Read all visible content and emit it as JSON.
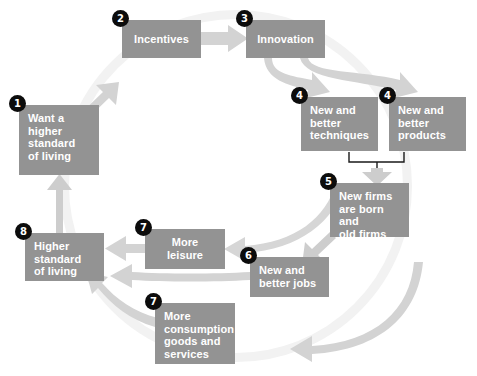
{
  "diagram": {
    "colors": {
      "box_fill": "#939393",
      "box_text": "#ffffff",
      "arrow_fill": "#cdcdcd",
      "badge_fill": "#0c0c0c",
      "badge_text": "#ffffff",
      "background": "#ffffff",
      "ring": "#f2f2f2"
    },
    "nodes": [
      {
        "id": "n1",
        "number": "1",
        "label": "Want a\nhigher\nstandard\nof living",
        "x": 19,
        "y": 105,
        "w": 80,
        "h": 70
      },
      {
        "id": "n2",
        "number": "2",
        "label": "Incentives",
        "x": 122,
        "y": 20,
        "w": 79,
        "h": 38
      },
      {
        "id": "n3",
        "number": "3",
        "label": "Innovation",
        "x": 246,
        "y": 20,
        "w": 79,
        "h": 38
      },
      {
        "id": "n4a",
        "number": "4",
        "label": "New and\nbetter\ntechniques",
        "x": 301,
        "y": 97,
        "w": 77,
        "h": 54
      },
      {
        "id": "n4b",
        "number": "4",
        "label": "New and\nbetter\nproducts",
        "x": 389,
        "y": 97,
        "w": 77,
        "h": 54
      },
      {
        "id": "n5",
        "number": "5",
        "label": "New firms\nare born and\nold firms die",
        "x": 330,
        "y": 183,
        "w": 79,
        "h": 54
      },
      {
        "id": "n6",
        "number": "6",
        "label": "New and\nbetter jobs",
        "x": 250,
        "y": 257,
        "w": 79,
        "h": 40
      },
      {
        "id": "n7a",
        "number": "7",
        "label": "More\nleisure",
        "x": 145,
        "y": 229,
        "w": 80,
        "h": 40
      },
      {
        "id": "n7b",
        "number": "7",
        "label": "More\nconsumption\ngoods and\nservices",
        "x": 155,
        "y": 303,
        "w": 80,
        "h": 61
      },
      {
        "id": "n8",
        "number": "8",
        "label": "Higher\nstandard\nof living",
        "x": 25,
        "y": 233,
        "w": 79,
        "h": 48
      }
    ],
    "flows": [
      {
        "name": "want-to-incentives",
        "from": "n1",
        "to": "n2"
      },
      {
        "name": "incentives-to-innovation",
        "from": "n2",
        "to": "n3"
      },
      {
        "name": "innovation-to-techniques",
        "from": "n3",
        "to": "n4a"
      },
      {
        "name": "innovation-to-products",
        "from": "n3",
        "to": "n4b"
      },
      {
        "name": "techniques-products-to-firms",
        "from": "n4a",
        "to": "n5"
      },
      {
        "name": "firms-to-jobs",
        "from": "n5",
        "to": "n6"
      },
      {
        "name": "firms-to-leisure",
        "from": "n5",
        "to": "n7a"
      },
      {
        "name": "jobs-to-standard",
        "from": "n6",
        "to": "n8"
      },
      {
        "name": "leisure-to-standard",
        "from": "n7a",
        "to": "n8"
      },
      {
        "name": "firms-to-consumption",
        "from": "n5",
        "to": "n7b"
      },
      {
        "name": "consumption-to-standard",
        "from": "n7b",
        "to": "n8"
      },
      {
        "name": "standard-to-want",
        "from": "n8",
        "to": "n1"
      }
    ]
  }
}
